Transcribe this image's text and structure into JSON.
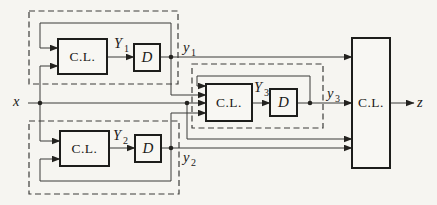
{
  "colors": {
    "background": "#f6f5f1",
    "ink": "#1d1d1b",
    "wire": "#3a3a38"
  },
  "blocks": {
    "cl1": "C.L.",
    "d1": "D",
    "cl2": "C.L.",
    "d2": "D",
    "cl3": "C.L.",
    "d3": "D",
    "clz": "C.L."
  },
  "signals": {
    "x": "x",
    "z": "z",
    "Y1": {
      "base": "Y",
      "sub": "1"
    },
    "y1": {
      "base": "y",
      "sub": "1"
    },
    "Y2": {
      "base": "Y",
      "sub": "2"
    },
    "y2": {
      "base": "y",
      "sub": "2"
    },
    "Y3": {
      "base": "Y",
      "sub": "3"
    },
    "y3": {
      "base": "y",
      "sub": "3"
    }
  }
}
